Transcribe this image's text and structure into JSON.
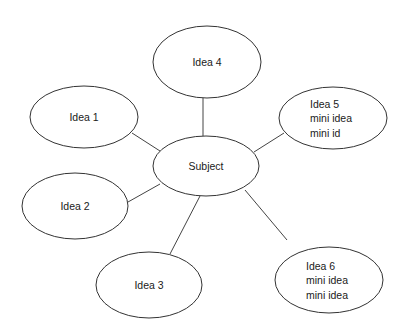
{
  "diagram": {
    "type": "mind-map",
    "center": {
      "id": "subject",
      "lines": [
        "Subject"
      ],
      "cx": 206,
      "cy": 166,
      "rx": 53,
      "ry": 30
    },
    "nodes": [
      {
        "id": "idea1",
        "lines": [
          "Idea 1"
        ],
        "cx": 84,
        "cy": 117,
        "rx": 54,
        "ry": 31
      },
      {
        "id": "idea2",
        "lines": [
          "Idea 2"
        ],
        "cx": 75,
        "cy": 206,
        "rx": 53,
        "ry": 33
      },
      {
        "id": "idea3",
        "lines": [
          "Idea 3"
        ],
        "cx": 149,
        "cy": 285,
        "rx": 53,
        "ry": 33
      },
      {
        "id": "idea4",
        "lines": [
          "Idea 4"
        ],
        "cx": 207,
        "cy": 62,
        "rx": 54,
        "ry": 36
      },
      {
        "id": "idea5",
        "lines": [
          "Idea 5",
          "mini idea",
          "mini id"
        ],
        "cx": 333,
        "cy": 118,
        "rx": 54,
        "ry": 31
      },
      {
        "id": "idea6",
        "lines": [
          "Idea 6",
          "mini idea",
          "mini idea"
        ],
        "cx": 329,
        "cy": 280,
        "rx": 54,
        "ry": 33
      }
    ],
    "edges": [
      {
        "from": "subject",
        "to": "idea1",
        "x1": 160,
        "y1": 151,
        "x2": 132,
        "y2": 133
      },
      {
        "from": "subject",
        "to": "idea2",
        "x1": 160,
        "y1": 184,
        "x2": 128,
        "y2": 202
      },
      {
        "from": "subject",
        "to": "idea3",
        "x1": 200,
        "y1": 196,
        "x2": 170,
        "y2": 254
      },
      {
        "from": "subject",
        "to": "idea4",
        "x1": 203,
        "y1": 136,
        "x2": 203,
        "y2": 98
      },
      {
        "from": "subject",
        "to": "idea5",
        "x1": 254,
        "y1": 152,
        "x2": 284,
        "y2": 133
      },
      {
        "from": "subject",
        "to": "idea6",
        "x1": 245,
        "y1": 190,
        "x2": 287,
        "y2": 240
      }
    ]
  }
}
